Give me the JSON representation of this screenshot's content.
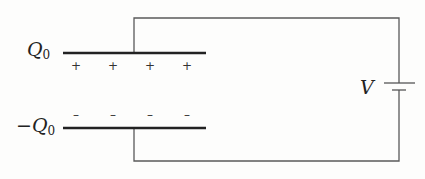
{
  "diagram": {
    "type": "parallel-plate capacitor connected to battery",
    "top_plate": {
      "label_symbol": "Q",
      "label_subscript": "0",
      "charge_signs": [
        "+",
        "+",
        "+",
        "+"
      ]
    },
    "bottom_plate": {
      "label_symbol": "−Q",
      "label_subscript": "0",
      "charge_signs": [
        "–",
        "–",
        "–",
        "–"
      ]
    },
    "battery": {
      "label": "V"
    },
    "colors": {
      "wire": "#555555",
      "plate": "#222222",
      "text": "#222222",
      "background": "#fdfdfc"
    }
  }
}
